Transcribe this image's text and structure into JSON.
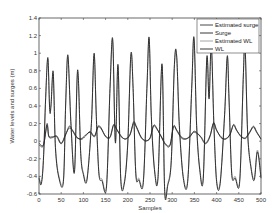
{
  "chart_data": {
    "type": "line",
    "title": "",
    "xlabel": "Samples",
    "ylabel": "Water levels and surges (m)",
    "xlim": [
      0,
      500
    ],
    "ylim": [
      -0.6,
      1.4
    ],
    "xticks": [
      0,
      50,
      100,
      150,
      200,
      250,
      300,
      350,
      400,
      450,
      500
    ],
    "yticks": [
      -0.6,
      -0.4,
      -0.2,
      0,
      0.2,
      0.4,
      0.6,
      0.8,
      1,
      1.2,
      1.4
    ],
    "ytick_labels": [
      "-0.6",
      "-0.4",
      "-0.2",
      "0",
      "0.2",
      "0.4",
      "0.6",
      "0.8",
      "1",
      "1.2",
      "1.4"
    ],
    "grid": false,
    "legend_position": "upper right",
    "series": [
      {
        "name": "Estimated surge",
        "color": "#333333",
        "x": [
          0,
          10,
          18,
          22,
          30,
          40,
          50,
          60,
          68,
          75,
          85,
          95,
          105,
          115,
          125,
          133,
          140,
          150,
          160,
          168,
          175,
          185,
          195,
          205,
          213,
          220,
          230,
          240,
          250,
          258,
          265,
          275,
          285,
          295,
          303,
          310,
          320,
          330,
          340,
          348,
          355,
          365,
          375,
          385,
          393,
          400,
          410,
          420,
          430,
          438,
          445,
          455,
          465,
          475,
          483,
          490,
          500
        ],
        "values": [
          -0.02,
          -0.04,
          0.18,
          0.05,
          0.04,
          0.06,
          -0.02,
          0.08,
          0.15,
          0.12,
          0.04,
          0.03,
          0.07,
          0.1,
          0.05,
          0.16,
          0.14,
          0.06,
          0.04,
          0.18,
          0.13,
          0.06,
          0.02,
          0.08,
          0.2,
          0.15,
          0.04,
          0.01,
          0.03,
          0.17,
          0.14,
          0.06,
          -0.03,
          -0.04,
          0.16,
          0.12,
          0.04,
          0.02,
          0.06,
          0.1,
          0.09,
          0.05,
          -0.02,
          0.06,
          0.2,
          0.12,
          0.05,
          0.02,
          0.08,
          0.18,
          0.12,
          0.06,
          0.03,
          0.1,
          0.16,
          0.1,
          0.03
        ]
      },
      {
        "name": "Surge",
        "color": "#222222",
        "x": [
          0,
          10,
          18,
          22,
          30,
          40,
          50,
          60,
          68,
          75,
          85,
          95,
          105,
          115,
          125,
          133,
          140,
          150,
          160,
          168,
          175,
          185,
          195,
          205,
          213,
          220,
          230,
          240,
          250,
          258,
          265,
          275,
          285,
          295,
          303,
          310,
          320,
          330,
          340,
          348,
          355,
          365,
          375,
          385,
          393,
          400,
          410,
          420,
          430,
          438,
          445,
          455,
          465,
          475,
          483,
          490,
          500
        ],
        "values": [
          -0.04,
          -0.05,
          0.2,
          0.06,
          0.05,
          0.05,
          -0.03,
          0.07,
          0.17,
          0.13,
          0.05,
          0.02,
          0.06,
          0.11,
          0.06,
          0.17,
          0.15,
          0.05,
          0.05,
          0.19,
          0.14,
          0.05,
          0.03,
          0.07,
          0.22,
          0.16,
          0.05,
          0.0,
          0.04,
          0.18,
          0.15,
          0.05,
          -0.04,
          -0.05,
          0.17,
          0.13,
          0.05,
          0.03,
          0.05,
          0.11,
          0.1,
          0.04,
          -0.03,
          0.05,
          0.21,
          0.13,
          0.04,
          0.03,
          0.07,
          0.19,
          0.13,
          0.05,
          0.04,
          0.11,
          0.17,
          0.11,
          0.02
        ]
      },
      {
        "name": "Estimated WL",
        "color": "#9a9a9a",
        "x": [
          0,
          5,
          10,
          15,
          20,
          24,
          27,
          32,
          37,
          45,
          55,
          60,
          65,
          72,
          80,
          87,
          94,
          100,
          108,
          118,
          124,
          129,
          135,
          142,
          152,
          160,
          166,
          172,
          178,
          184,
          192,
          200,
          207,
          212,
          218,
          225,
          235,
          243,
          248,
          253,
          260,
          268,
          277,
          283,
          290,
          298,
          305,
          310,
          316,
          325,
          335,
          344,
          349,
          355,
          362,
          370,
          378,
          383,
          388,
          394,
          400,
          408,
          418,
          424,
          428,
          434,
          442,
          452,
          460,
          464,
          470,
          478,
          485,
          492,
          500
        ],
        "values": [
          -0.4,
          -0.47,
          -0.2,
          0.5,
          0.93,
          0.38,
          0.42,
          0.76,
          -0.05,
          -0.4,
          -0.44,
          0.4,
          0.96,
          0.2,
          -0.33,
          0.78,
          -0.12,
          -0.36,
          -0.42,
          0.2,
          0.97,
          0.3,
          -0.35,
          -0.43,
          -0.5,
          0.6,
          1.14,
          0.0,
          0.85,
          -0.4,
          -0.47,
          0.0,
          0.97,
          0.6,
          -0.35,
          -0.42,
          -0.45,
          0.6,
          1.16,
          0.3,
          -0.3,
          -0.4,
          0.86,
          -0.55,
          -0.48,
          -0.2,
          0.85,
          0.97,
          0.2,
          -0.4,
          -0.44,
          0.6,
          1.16,
          0.2,
          -0.3,
          -0.4,
          0.93,
          0.5,
          1.08,
          0.2,
          -0.44,
          -0.46,
          0.3,
          0.95,
          0.5,
          -0.35,
          -0.4,
          -0.44,
          0.7,
          1.08,
          0.1,
          -0.3,
          -0.42,
          -0.1,
          -0.4
        ]
      },
      {
        "name": "WL",
        "color": "#222222",
        "x": [
          0,
          5,
          10,
          15,
          20,
          24,
          27,
          32,
          37,
          45,
          55,
          60,
          65,
          72,
          80,
          87,
          94,
          100,
          108,
          118,
          124,
          129,
          135,
          142,
          152,
          160,
          166,
          172,
          178,
          184,
          192,
          200,
          207,
          212,
          218,
          225,
          235,
          243,
          248,
          253,
          260,
          268,
          277,
          283,
          290,
          298,
          305,
          310,
          316,
          325,
          335,
          344,
          349,
          355,
          362,
          370,
          378,
          383,
          388,
          394,
          400,
          408,
          418,
          424,
          428,
          434,
          442,
          452,
          460,
          464,
          470,
          478,
          485,
          492,
          500
        ],
        "values": [
          -0.42,
          -0.49,
          -0.22,
          0.5,
          0.95,
          0.36,
          0.4,
          0.79,
          -0.07,
          -0.42,
          -0.46,
          0.4,
          0.98,
          0.18,
          -0.35,
          0.81,
          -0.14,
          -0.38,
          -0.44,
          0.2,
          1.0,
          0.28,
          -0.37,
          -0.45,
          -0.52,
          0.6,
          1.16,
          -0.02,
          0.87,
          -0.42,
          -0.49,
          -0.02,
          0.99,
          0.6,
          -0.37,
          -0.44,
          -0.47,
          0.6,
          1.18,
          0.28,
          -0.32,
          -0.42,
          0.88,
          -0.57,
          -0.5,
          -0.22,
          0.87,
          0.98,
          0.18,
          -0.42,
          -0.46,
          0.6,
          1.18,
          0.18,
          -0.32,
          -0.42,
          0.95,
          0.48,
          1.1,
          0.18,
          -0.46,
          -0.48,
          0.3,
          0.97,
          0.48,
          -0.37,
          -0.42,
          -0.46,
          0.7,
          1.1,
          0.08,
          -0.32,
          -0.44,
          -0.12,
          -0.42
        ]
      }
    ]
  },
  "layout": {
    "plot": {
      "left": 39,
      "top": 18,
      "right": 261,
      "bottom": 194
    },
    "legend": {
      "left": 197,
      "top": 19,
      "right": 259,
      "bottom": 53
    }
  }
}
